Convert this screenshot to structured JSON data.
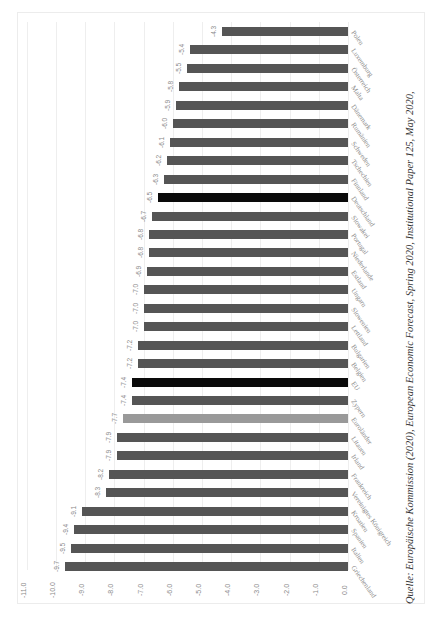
{
  "chart_data": {
    "type": "bar",
    "orientation": "horizontal (image rotated 90°)",
    "title": "",
    "xlabel": "",
    "ylabel": "",
    "xlim": [
      -11.0,
      0.0
    ],
    "grid": true,
    "legend": null,
    "tick_labels": [
      "-11.0",
      "-10.0",
      "-9.0",
      "-8.0",
      "-7.0",
      "-6.0",
      "-5.0",
      "-4.0",
      "-3.0",
      "-2.0",
      "-1.0",
      "0.0"
    ],
    "categories": [
      "Polen",
      "Luxemburg",
      "Österreich",
      "Malta",
      "Dänemark",
      "Rumänien",
      "Schweden",
      "Tschechien",
      "Finnland",
      "Deutschland",
      "Slowakei",
      "Portugal",
      "Niederlande",
      "Estland",
      "Ungarn",
      "Slowenien",
      "Lettland",
      "Bulgarien",
      "Belgien",
      "EU",
      "Zypern",
      "Euroländer",
      "Litauen",
      "Irland",
      "Frankreich",
      "Vereinigtes Königreich",
      "Kroatien",
      "Spanien",
      "Italien",
      "Griechenland"
    ],
    "values": [
      -4.3,
      -5.4,
      -5.5,
      -5.8,
      -5.9,
      -6.0,
      -6.1,
      -6.2,
      -6.3,
      -6.5,
      -6.7,
      -6.8,
      -6.8,
      -6.9,
      -7.0,
      -7.0,
      -7.0,
      -7.2,
      -7.2,
      -7.4,
      -7.4,
      -7.7,
      -7.9,
      -7.9,
      -8.2,
      -8.3,
      -9.1,
      -9.4,
      -9.5,
      -9.7
    ],
    "value_labels": [
      "-4.3",
      "-5.4",
      "-5.5",
      "-5.8",
      "-5.9",
      "-6.0",
      "-6.1",
      "-6.2",
      "-6.3",
      "-6.5",
      "-6.7",
      "-6.8",
      "-6.8",
      "-6.9",
      "-7.0",
      "-7.0",
      "-7.0",
      "-7.2",
      "-7.2",
      "-7.4",
      "-7.4",
      "-7.7",
      "-7.9",
      "-7.9",
      "-8.2",
      "-8.3",
      "-9.1",
      "-9.4",
      "-9.5",
      "-9.7"
    ],
    "highlight": {
      "Deutschland": "black",
      "EU": "black",
      "Euroländer": "light-gray"
    },
    "colors": {
      "default": "#555555",
      "black": "#0a0a0a",
      "light-gray": "#999999"
    }
  },
  "caption": "Quelle: Europäische Kommission (2020), European Economic Forecast, Spring 2020, Institutional Paper 125, May 2020,"
}
